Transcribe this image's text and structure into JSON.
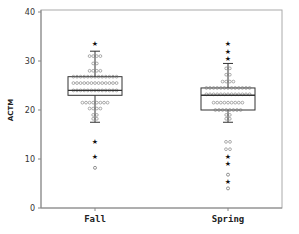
{
  "chart_data": {
    "type": "box",
    "title": "",
    "xlabel": "",
    "ylabel": "ACTM",
    "ylim": [
      0,
      40
    ],
    "yticks": [
      0,
      10,
      20,
      30,
      40
    ],
    "categories": [
      "Fall",
      "Spring"
    ],
    "grid": false,
    "legend": null,
    "series": [
      {
        "name": "Fall",
        "whisker_low": 17.5,
        "q1": 23,
        "median": 24,
        "q3": 26.8,
        "whisker_high": 32,
        "dot_rows": [
          {
            "y": 31,
            "count": 4
          },
          {
            "y": 29.5,
            "count": 2
          },
          {
            "y": 28,
            "count": 4
          },
          {
            "y": 26.8,
            "count": 13
          },
          {
            "y": 25.5,
            "count": 13
          },
          {
            "y": 24,
            "count": 13
          },
          {
            "y": 21.5,
            "count": 8
          },
          {
            "y": 20.3,
            "count": 4
          },
          {
            "y": 19,
            "count": 2
          },
          {
            "y": 18.2,
            "count": 2
          }
        ],
        "outliers": [
          {
            "value": 33.5,
            "marker": "star"
          },
          {
            "value": 13.5,
            "marker": "star"
          },
          {
            "value": 10.5,
            "marker": "star"
          },
          {
            "value": 8.2,
            "marker": "circle"
          }
        ]
      },
      {
        "name": "Spring",
        "whisker_low": 17.5,
        "q1": 20,
        "median": 23,
        "q3": 24.5,
        "whisker_high": 29.5,
        "dot_rows": [
          {
            "y": 28.5,
            "count": 2
          },
          {
            "y": 27.2,
            "count": 2
          },
          {
            "y": 25.8,
            "count": 4
          },
          {
            "y": 24.5,
            "count": 13
          },
          {
            "y": 23.2,
            "count": 13
          },
          {
            "y": 21.5,
            "count": 9
          },
          {
            "y": 20,
            "count": 8
          },
          {
            "y": 19,
            "count": 2
          },
          {
            "y": 18.2,
            "count": 2
          }
        ],
        "outliers": [
          {
            "value": 33.5,
            "marker": "star"
          },
          {
            "value": 32,
            "marker": "star"
          },
          {
            "value": 30.5,
            "marker": "star"
          },
          {
            "value": 13.5,
            "marker": "circle2"
          },
          {
            "value": 12,
            "marker": "circle2"
          },
          {
            "value": 10.5,
            "marker": "star"
          },
          {
            "value": 9,
            "marker": "star"
          },
          {
            "value": 6.8,
            "marker": "circle"
          },
          {
            "value": 5.5,
            "marker": "star"
          },
          {
            "value": 4,
            "marker": "circle"
          }
        ]
      }
    ]
  },
  "colors": {
    "axis": "#888888",
    "box": "#333333",
    "dot": "#777777",
    "star": "#111111"
  }
}
